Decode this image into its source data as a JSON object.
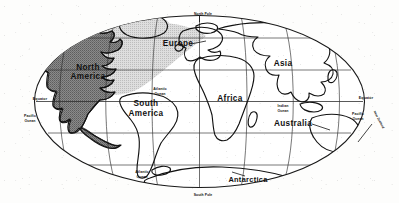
{
  "map": {
    "title": "World Map",
    "projection": "oval world projection",
    "frame": {
      "cx": 199.5,
      "cy": 101.5,
      "rx": 165,
      "ry": 86
    },
    "colors": {
      "background": "#fdfdfc",
      "outline": "#111111",
      "graticule": "#2a2a2a",
      "highlight_dark": "#7e7e7e",
      "highlight_light": "#c9c9c9",
      "label_text": "#111111"
    },
    "continents": [
      {
        "id": "north-america",
        "label": "North America",
        "x": 88,
        "y": 72,
        "highlight": "dark"
      },
      {
        "id": "south-america",
        "label": "South America",
        "x": 146,
        "y": 108,
        "highlight": "none"
      },
      {
        "id": "europe",
        "label": "Europe",
        "x": 178,
        "y": 44,
        "highlight": "light"
      },
      {
        "id": "africa",
        "label": "Africa",
        "x": 230,
        "y": 99,
        "highlight": "none"
      },
      {
        "id": "asia",
        "label": "Asia",
        "x": 283,
        "y": 64,
        "highlight": "none"
      },
      {
        "id": "australia",
        "label": "Australia",
        "x": 293,
        "y": 124,
        "highlight": "none"
      },
      {
        "id": "antarctica",
        "label": "Antarctica",
        "x": 248,
        "y": 180,
        "highlight": "none"
      }
    ],
    "oceans": [
      {
        "id": "pacific-ocean-west",
        "line1": "Pacific",
        "line2": "Ocean",
        "x": 30,
        "y": 117
      },
      {
        "id": "pacific-ocean-east",
        "line1": "Pacific",
        "line2": "Ocean",
        "x": 358,
        "y": 115
      },
      {
        "id": "atlantic-ocean-north",
        "line1": "Atlantic",
        "line2": "Ocean",
        "x": 160,
        "y": 91
      },
      {
        "id": "atlantic-ocean-south",
        "line1": "Atlantic",
        "line2": "Ocean",
        "x": 142,
        "y": 174
      },
      {
        "id": "indian-ocean",
        "line1": "Indian",
        "line2": "Ocean",
        "x": 283,
        "y": 108
      }
    ],
    "reference_lines": [
      {
        "id": "equator-west",
        "label": "Equator",
        "x": 40,
        "y": 101
      },
      {
        "id": "equator-east",
        "label": "Equator",
        "x": 366,
        "y": 100
      },
      {
        "id": "north-pole",
        "label": "North Pole",
        "x": 203,
        "y": 17
      },
      {
        "id": "south-pole",
        "label": "South Pole",
        "x": 203,
        "y": 194
      }
    ],
    "annotations": [
      {
        "id": "new-zealand-tick",
        "label": "New Zealand",
        "x": 381,
        "y": 118
      }
    ]
  }
}
